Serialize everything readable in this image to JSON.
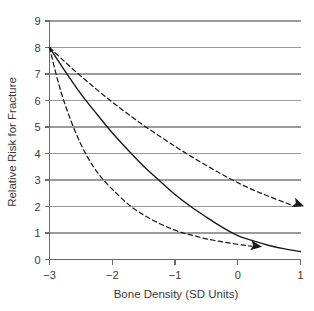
{
  "chart_data": {
    "type": "line",
    "title": "",
    "xlabel": "Bone Density (SD Units)",
    "ylabel": "Relative Risk for Fracture",
    "xlim": [
      -3,
      1
    ],
    "ylim": [
      0,
      9
    ],
    "xticks": [
      -3,
      -2,
      -1,
      0,
      1
    ],
    "xticklabels": [
      "−3",
      "−2",
      "−1",
      "0",
      "1"
    ],
    "yticks": [
      0,
      1,
      2,
      3,
      4,
      5,
      6,
      7,
      8,
      9
    ],
    "yticklabels": [
      "0",
      "1",
      "2",
      "3",
      "4",
      "5",
      "6",
      "7",
      "8",
      "9"
    ],
    "grid": "horizontal",
    "grid_color": "#9a9a9a",
    "axis_color": "#6b6b6b",
    "curve_color": "#1a1a1a",
    "legend": "none",
    "series": [
      {
        "name": "Upper confidence limit",
        "style": "dashed",
        "arrow": true,
        "x": [
          -3.0,
          -2.75,
          -2.5,
          -2.25,
          -2.0,
          -1.75,
          -1.5,
          -1.25,
          -1.0,
          -0.75,
          -0.5,
          -0.25,
          0.0,
          0.25,
          0.5,
          0.75,
          0.9
        ],
        "y": [
          8.0,
          7.45,
          6.92,
          6.42,
          5.94,
          5.49,
          5.06,
          4.66,
          4.27,
          3.9,
          3.55,
          3.21,
          2.9,
          2.62,
          2.38,
          2.15,
          2.02
        ]
      },
      {
        "name": "Point estimate",
        "style": "solid",
        "arrow": false,
        "x": [
          -3.0,
          -2.75,
          -2.5,
          -2.25,
          -2.0,
          -1.75,
          -1.5,
          -1.25,
          -1.0,
          -0.75,
          -0.5,
          -0.25,
          0.0,
          0.25,
          0.5,
          0.75,
          1.0
        ],
        "y": [
          8.0,
          7.1,
          6.25,
          5.5,
          4.78,
          4.13,
          3.52,
          2.98,
          2.45,
          2.0,
          1.6,
          1.22,
          0.9,
          0.7,
          0.53,
          0.4,
          0.3
        ]
      },
      {
        "name": "Lower confidence limit",
        "style": "dashed",
        "arrow": true,
        "x": [
          -3.0,
          -2.85,
          -2.7,
          -2.5,
          -2.3,
          -2.1,
          -1.9,
          -1.7,
          -1.5,
          -1.3,
          -1.1,
          -0.9,
          -0.7,
          -0.5,
          -0.3,
          -0.1,
          0.1,
          0.23
        ],
        "y": [
          8.0,
          6.6,
          5.5,
          4.35,
          3.5,
          2.9,
          2.42,
          2.0,
          1.68,
          1.42,
          1.2,
          1.02,
          0.9,
          0.78,
          0.69,
          0.61,
          0.54,
          0.5
        ]
      }
    ]
  }
}
